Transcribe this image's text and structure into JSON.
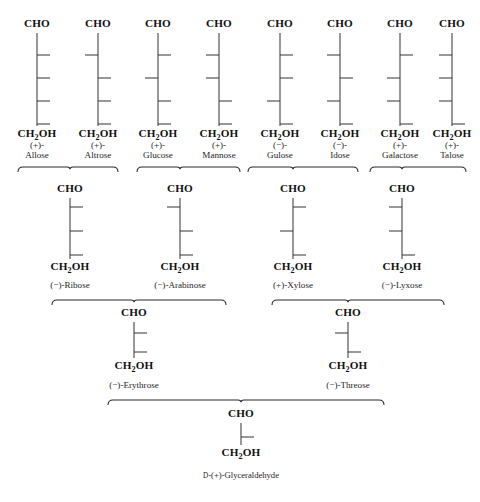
{
  "figure": {
    "background_color": "#ffffff",
    "line_color": "#3b3b3b",
    "text_color": "#111111"
  },
  "labels": {
    "cho": "CHO",
    "ch2oh_prefix": "CH",
    "ch2oh_sub": "2",
    "ch2oh_suffix": "OH"
  },
  "chart_data": {
    "type": "diagram",
    "notation": "tick 'R' = hydroxyl drawn to the right of the chain, 'L' = hydroxyl drawn to the left",
    "rows": [
      {
        "row_name": "hexoses",
        "carbons": 6,
        "stereocenters": 4,
        "sugars": [
          {
            "name": "Allose",
            "rotation": "(+)-",
            "label_lines": [
              "(+)-",
              "Allose"
            ],
            "ticks": [
              "R",
              "R",
              "R",
              "R"
            ],
            "x": 37
          },
          {
            "name": "Altrose",
            "rotation": "(+)-",
            "label_lines": [
              "(+)-",
              "Altrose"
            ],
            "ticks": [
              "L",
              "R",
              "R",
              "R"
            ],
            "x": 98
          },
          {
            "name": "Glucose",
            "rotation": "(+)-",
            "label_lines": [
              "(+)-",
              "Glucose"
            ],
            "ticks": [
              "R",
              "L",
              "R",
              "R"
            ],
            "x": 158
          },
          {
            "name": "Mannose",
            "rotation": "(+)-",
            "label_lines": [
              "(+)-",
              "Mannose"
            ],
            "ticks": [
              "L",
              "L",
              "R",
              "R"
            ],
            "x": 219
          },
          {
            "name": "Gulose",
            "rotation": "(−)-",
            "label_lines": [
              "(−)-",
              "Gulose"
            ],
            "ticks": [
              "R",
              "R",
              "L",
              "R"
            ],
            "x": 280
          },
          {
            "name": "Idose",
            "rotation": "(−)-",
            "label_lines": [
              "(−)-",
              "Idose"
            ],
            "ticks": [
              "L",
              "R",
              "L",
              "R"
            ],
            "x": 340
          },
          {
            "name": "Galactose",
            "rotation": "(+)-",
            "label_lines": [
              "(+)-",
              "Galactose"
            ],
            "ticks": [
              "R",
              "L",
              "L",
              "R"
            ],
            "x": 400
          },
          {
            "name": "Talose",
            "rotation": "(+)-",
            "label_lines": [
              "(+)-",
              "Talose"
            ],
            "ticks": [
              "L",
              "L",
              "L",
              "R"
            ],
            "x": 452
          }
        ]
      },
      {
        "row_name": "pentoses",
        "carbons": 5,
        "stereocenters": 3,
        "sugars": [
          {
            "name": "Ribose",
            "rotation": "(−)-",
            "label": "(−)-Ribose",
            "ticks": [
              "R",
              "R",
              "R"
            ],
            "x": 70
          },
          {
            "name": "Arabinose",
            "rotation": "(−)-",
            "label": "(−)-Arabinose",
            "ticks": [
              "L",
              "R",
              "R"
            ],
            "x": 180
          },
          {
            "name": "Xylose",
            "rotation": "(+)-",
            "label": "(+)-Xylose",
            "ticks": [
              "R",
              "L",
              "R"
            ],
            "x": 293
          },
          {
            "name": "Lyxose",
            "rotation": "(−)-",
            "label": "(−)-Lyxose",
            "ticks": [
              "L",
              "L",
              "R"
            ],
            "x": 402
          }
        ]
      },
      {
        "row_name": "tetroses",
        "carbons": 4,
        "stereocenters": 2,
        "sugars": [
          {
            "name": "Erythrose",
            "rotation": "(−)-",
            "label": "(−)-Erythrose",
            "ticks": [
              "R",
              "R"
            ],
            "x": 134
          },
          {
            "name": "Threose",
            "rotation": "(−)-",
            "label": "(−)-Threose",
            "ticks": [
              "L",
              "R"
            ],
            "x": 348
          }
        ]
      },
      {
        "row_name": "triose",
        "carbons": 3,
        "stereocenters": 1,
        "sugars": [
          {
            "name": "Glyceraldehyde",
            "rotation": "D-(+)-",
            "label": "D-(+)-Glyceraldehyde",
            "ticks": [
              "R"
            ],
            "x": 241
          }
        ]
      }
    ],
    "brackets": [
      {
        "from": "Allose",
        "to": "Talose",
        "child": "Ribose",
        "pair": [
          "Allose",
          "Altrose"
        ],
        "x1": 18,
        "x2": 118,
        "child_x": 70
      },
      {
        "from": "Glucose",
        "to": "Mannose",
        "child": "Arabinose",
        "pair": [
          "Glucose",
          "Mannose"
        ],
        "x1": 137,
        "x2": 240,
        "child_x": 180
      },
      {
        "from": "Gulose",
        "to": "Idose",
        "child": "Xylose",
        "pair": [
          "Gulose",
          "Idose"
        ],
        "x1": 248,
        "x2": 358,
        "child_x": 293
      },
      {
        "from": "Galactose",
        "to": "Talose",
        "child": "Lyxose",
        "pair": [
          "Galactose",
          "Talose"
        ],
        "x1": 370,
        "x2": 466,
        "child_x": 402
      },
      {
        "from": "Ribose",
        "to": "Arabinose",
        "child": "Erythrose",
        "pair": [
          "Ribose",
          "Arabinose"
        ],
        "x1": 52,
        "x2": 226,
        "child_x": 134
      },
      {
        "from": "Xylose",
        "to": "Lyxose",
        "child": "Threose",
        "pair": [
          "Xylose",
          "Lyxose"
        ],
        "x1": 272,
        "x2": 444,
        "child_x": 348
      },
      {
        "from": "Erythrose",
        "to": "Threose",
        "child": "Glyceraldehyde",
        "pair": [
          "Erythrose",
          "Threose"
        ],
        "x1": 108,
        "x2": 384,
        "child_x": 241
      }
    ]
  }
}
